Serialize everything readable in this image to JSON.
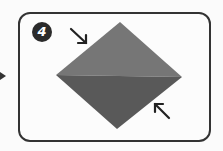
{
  "step": {
    "number": "4"
  },
  "diagram": {
    "shape": "diamond",
    "colors": {
      "upper": "#767676",
      "lower": "#595959",
      "frame": "#333333",
      "badge": "#2b2b2b"
    },
    "arrows": [
      {
        "icon": "arrow-down-right-icon",
        "position": "top-left"
      },
      {
        "icon": "arrow-up-left-icon",
        "position": "bottom-right"
      }
    ]
  }
}
